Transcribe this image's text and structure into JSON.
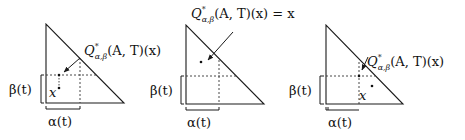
{
  "figure": {
    "colors": {
      "line": "#1a1a1a",
      "dashed": "#333333"
    },
    "panels": [
      {
        "id": "left",
        "q_label": {
          "main": "Q",
          "sup": "*",
          "sub": "α,β",
          "rest": "(A, T)(x)"
        },
        "x_label": "x",
        "beta_label": "β(t)",
        "alpha_label": "α(t)"
      },
      {
        "id": "middle",
        "q_label": {
          "main": "Q",
          "sup": "*",
          "sub": "α,β",
          "rest": "(A, T)(x) = x"
        },
        "beta_label": "β(t)",
        "alpha_label": "α(t)"
      },
      {
        "id": "right",
        "q_label": {
          "main": "Q",
          "sup": "*",
          "sub": "α,β",
          "rest": "(A, T)(x)"
        },
        "x_label": "x",
        "beta_label": "β(t)",
        "alpha_label": "α(t)"
      }
    ]
  }
}
